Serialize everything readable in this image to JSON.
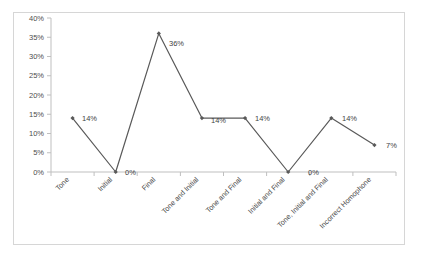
{
  "chart_data": {
    "type": "line",
    "title": "",
    "subtitle": "",
    "xlabel": "",
    "ylabel": "",
    "ylim": [
      0,
      40
    ],
    "ytick_labels": [
      "0%",
      "5%",
      "10%",
      "15%",
      "20%",
      "25%",
      "30%",
      "35%",
      "40%"
    ],
    "ytick_values": [
      0,
      5,
      10,
      15,
      20,
      25,
      30,
      35,
      40
    ],
    "grid": false,
    "legend": "none",
    "categories": [
      "Tone",
      "Initial",
      "Final",
      "Tone and Initial",
      "Tone and Final",
      "Initial and Final",
      "Tone, Initial and Final",
      "Incorrect Homophone"
    ],
    "values": [
      14,
      0,
      36,
      14,
      14,
      0,
      14,
      7
    ],
    "data_labels": [
      "14%",
      "0%",
      "36%",
      "14%",
      "14%",
      "0%",
      "14%",
      "7%"
    ],
    "series": [
      {
        "name": "",
        "values": [
          14,
          0,
          36,
          14,
          14,
          0,
          14,
          7
        ]
      }
    ],
    "marker": "diamond",
    "line_color": "#595959",
    "marker_color": "#595959",
    "axis_color": "#bfbfbf",
    "border_color": "#d6d6d6",
    "background_color": "#ffffff"
  }
}
